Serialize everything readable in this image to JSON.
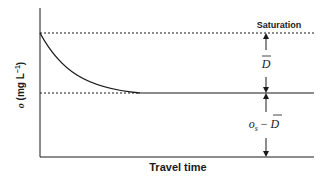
{
  "diagram": {
    "type": "oxygen-deficit-curve",
    "y_axis": {
      "label_symbol": "o",
      "label_units": " (mg L",
      "label_exp": "−1",
      "label_close": ")"
    },
    "x_axis": {
      "label": "Travel time"
    },
    "saturation_label": "Saturation",
    "deficit_label": "D",
    "lower_label_os": "o",
    "lower_label_sub": "s",
    "lower_label_minus": " − ",
    "lower_label_d": "D",
    "colors": {
      "line": "#1a1a1a",
      "background": "#ffffff"
    }
  }
}
